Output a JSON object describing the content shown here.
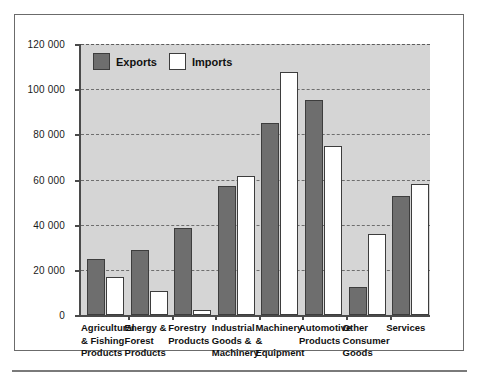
{
  "chart_data": {
    "type": "bar",
    "title": "",
    "subtitle": "",
    "xlabel": "",
    "ylabel": "",
    "ylim": [
      0,
      120000
    ],
    "yticks": [
      0,
      20000,
      40000,
      60000,
      80000,
      100000,
      120000
    ],
    "ytick_labels": [
      "0",
      "20 000",
      "40 000",
      "60 000",
      "80 000",
      "100 000",
      "120 000"
    ],
    "grid": true,
    "legend_position": "top-left",
    "categories": [
      "Agricultural\n& Fishing\nProducts",
      "Energy &\nForest\nProducts",
      "Forestry\nProducts",
      "Industrial\nGoods &\nMachinery",
      "Machinery &\nEquipment",
      "Automotive\nProducts",
      "Other\nConsumer\nGoods",
      "Services"
    ],
    "series": [
      {
        "name": "Exports",
        "color": "#6e6e6e",
        "values": [
          25000,
          29000,
          38500,
          57000,
          85000,
          95000,
          12500,
          52500
        ]
      },
      {
        "name": "Imports",
        "color": "#ffffff",
        "values": [
          17000,
          10500,
          2200,
          61500,
          107500,
          75000,
          36000,
          58000
        ]
      }
    ]
  },
  "legend": {
    "items": [
      {
        "label": "Exports"
      },
      {
        "label": "Imports"
      }
    ]
  },
  "colors": {
    "plot_background": "#d5d5d5",
    "axis": "#4a4a4a",
    "gridline": "#6e6e6e",
    "exports": "#6e6e6e",
    "imports": "#ffffff",
    "bar_outline": "#3d3d3d",
    "frame": "#6b6b6b"
  }
}
